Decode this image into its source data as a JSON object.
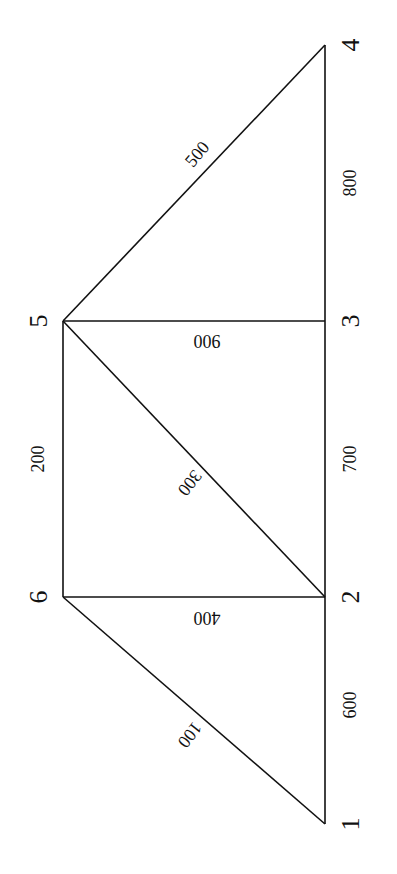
{
  "diagram": {
    "type": "truss",
    "orientation": "rotated-90-ccw",
    "nodes": [
      {
        "id": "1",
        "label": "1",
        "x": 325,
        "y": 824,
        "lx": 350,
        "ly": 824
      },
      {
        "id": "2",
        "label": "2",
        "x": 325,
        "y": 597,
        "lx": 350,
        "ly": 597
      },
      {
        "id": "3",
        "label": "3",
        "x": 325,
        "y": 321,
        "lx": 350,
        "ly": 321
      },
      {
        "id": "4",
        "label": "4",
        "x": 325,
        "y": 45,
        "lx": 350,
        "ly": 45
      },
      {
        "id": "5",
        "label": "5",
        "x": 63,
        "y": 321,
        "lx": 38,
        "ly": 321
      },
      {
        "id": "6",
        "label": "6",
        "x": 63,
        "y": 597,
        "lx": 38,
        "ly": 597
      }
    ],
    "members": [
      {
        "id": "100",
        "label": "100",
        "from": "1",
        "to": "6",
        "lx": 190,
        "ly": 735,
        "rot": 128
      },
      {
        "id": "200",
        "label": "200",
        "from": "6",
        "to": "5",
        "lx": 38,
        "ly": 459,
        "rot": -90
      },
      {
        "id": "300",
        "label": "300",
        "from": "5",
        "to": "2",
        "lx": 190,
        "ly": 483,
        "rot": 128
      },
      {
        "id": "400",
        "label": "400",
        "from": "6",
        "to": "2",
        "lx": 207,
        "ly": 618,
        "rot": 180
      },
      {
        "id": "500",
        "label": "500",
        "from": "5",
        "to": "4",
        "lx": 197,
        "ly": 154,
        "rot": -50
      },
      {
        "id": "600",
        "label": "600",
        "from": "1",
        "to": "2",
        "lx": 350,
        "ly": 705,
        "rot": -90
      },
      {
        "id": "700",
        "label": "700",
        "from": "2",
        "to": "3",
        "lx": 350,
        "ly": 459,
        "rot": -90
      },
      {
        "id": "800",
        "label": "800",
        "from": "3",
        "to": "4",
        "lx": 350,
        "ly": 183,
        "rot": -90
      },
      {
        "id": "900",
        "label": "900",
        "from": "5",
        "to": "3",
        "lx": 207,
        "ly": 341,
        "rot": 180
      }
    ]
  }
}
